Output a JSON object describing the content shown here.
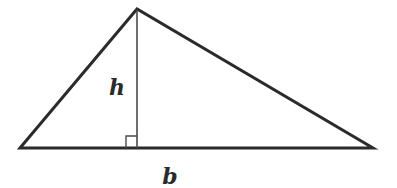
{
  "diagram": {
    "type": "triangle-area",
    "labels": {
      "height": "h",
      "base": "b"
    },
    "vertices": {
      "apex": [
        137,
        9
      ],
      "left": [
        20,
        148
      ],
      "right": [
        373,
        148
      ],
      "foot_of_altitude": [
        137,
        148
      ]
    },
    "right_angle_marker_size": 11,
    "colors": {
      "triangle_stroke": "#2b2b2b",
      "altitude_stroke": "#4a4a4a",
      "background": "#ffffff"
    }
  }
}
